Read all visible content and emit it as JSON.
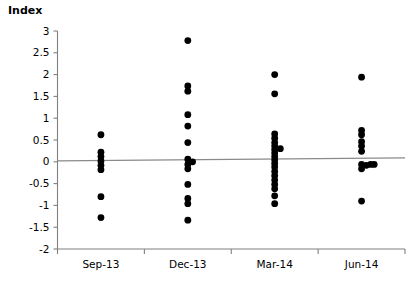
{
  "chart_data": {
    "type": "scatter",
    "title": "",
    "ylabel": "Index",
    "xlabel": "",
    "categories": [
      "Sep-13",
      "Dec-13",
      "Mar-14",
      "Jun-14"
    ],
    "ylim": [
      -2,
      3
    ],
    "ytick_labels": [
      "3",
      "2.5",
      "2",
      "1.5",
      "1",
      "0.5",
      "0",
      "-0.5",
      "-1",
      "-1.5",
      "-2"
    ],
    "ytick_values": [
      3,
      2.5,
      2,
      1.5,
      1,
      0.5,
      0,
      -0.5,
      -1,
      -1.5,
      -2
    ],
    "grid": false,
    "legend": "none",
    "marker_color": "#000000",
    "trend_line": {
      "visible": true,
      "color": "#8a8a8a",
      "y_left": 0.02,
      "y_right": 0.09
    },
    "series": [
      {
        "name": "Sep-13",
        "category_index": 0,
        "points": [
          {
            "jitter": 0.0,
            "y": 0.62
          },
          {
            "jitter": 0.0,
            "y": 0.22
          },
          {
            "jitter": 0.0,
            "y": 0.12
          },
          {
            "jitter": 0.0,
            "y": 0.02
          },
          {
            "jitter": 0.0,
            "y": -0.08
          },
          {
            "jitter": 0.0,
            "y": -0.18
          },
          {
            "jitter": 0.0,
            "y": -0.8
          },
          {
            "jitter": 0.0,
            "y": -1.28
          }
        ]
      },
      {
        "name": "Dec-13",
        "category_index": 1,
        "points": [
          {
            "jitter": 0.0,
            "y": 2.78
          },
          {
            "jitter": 0.0,
            "y": 1.74
          },
          {
            "jitter": 0.0,
            "y": 1.62
          },
          {
            "jitter": 0.0,
            "y": 1.08
          },
          {
            "jitter": 0.0,
            "y": 0.82
          },
          {
            "jitter": 0.0,
            "y": 0.44
          },
          {
            "jitter": 0.0,
            "y": 0.06
          },
          {
            "jitter": 0.0,
            "y": -0.06
          },
          {
            "jitter": 0.0,
            "y": -0.16
          },
          {
            "jitter": 0.055,
            "y": 0.0
          },
          {
            "jitter": 0.0,
            "y": -0.52
          },
          {
            "jitter": 0.0,
            "y": -0.84
          },
          {
            "jitter": 0.0,
            "y": -0.96
          },
          {
            "jitter": 0.0,
            "y": -1.34
          }
        ]
      },
      {
        "name": "Mar-14",
        "category_index": 2,
        "points": [
          {
            "jitter": 0.0,
            "y": 2.0
          },
          {
            "jitter": 0.0,
            "y": 1.56
          },
          {
            "jitter": 0.0,
            "y": 0.64
          },
          {
            "jitter": 0.0,
            "y": 0.54
          },
          {
            "jitter": 0.0,
            "y": 0.44
          },
          {
            "jitter": 0.0,
            "y": 0.36
          },
          {
            "jitter": 0.0,
            "y": 0.28
          },
          {
            "jitter": 0.0,
            "y": 0.2
          },
          {
            "jitter": 0.0,
            "y": 0.12
          },
          {
            "jitter": 0.0,
            "y": 0.04
          },
          {
            "jitter": 0.0,
            "y": -0.04
          },
          {
            "jitter": 0.0,
            "y": -0.12
          },
          {
            "jitter": 0.0,
            "y": -0.22
          },
          {
            "jitter": 0.0,
            "y": -0.32
          },
          {
            "jitter": 0.0,
            "y": -0.42
          },
          {
            "jitter": 0.0,
            "y": -0.52
          },
          {
            "jitter": 0.0,
            "y": -0.62
          },
          {
            "jitter": 0.0,
            "y": -0.78
          },
          {
            "jitter": 0.0,
            "y": -0.96
          },
          {
            "jitter": 0.065,
            "y": 0.3
          }
        ]
      },
      {
        "name": "Jun-14",
        "category_index": 3,
        "points": [
          {
            "jitter": 0.0,
            "y": 1.94
          },
          {
            "jitter": 0.0,
            "y": 0.72
          },
          {
            "jitter": 0.0,
            "y": 0.62
          },
          {
            "jitter": 0.0,
            "y": 0.46
          },
          {
            "jitter": 0.0,
            "y": 0.36
          },
          {
            "jitter": 0.0,
            "y": 0.24
          },
          {
            "jitter": 0.0,
            "y": -0.06
          },
          {
            "jitter": 0.0,
            "y": -0.16
          },
          {
            "jitter": 0.055,
            "y": -0.08
          },
          {
            "jitter": 0.105,
            "y": -0.06
          },
          {
            "jitter": 0.145,
            "y": -0.06
          },
          {
            "jitter": 0.0,
            "y": -0.9
          }
        ]
      }
    ]
  }
}
